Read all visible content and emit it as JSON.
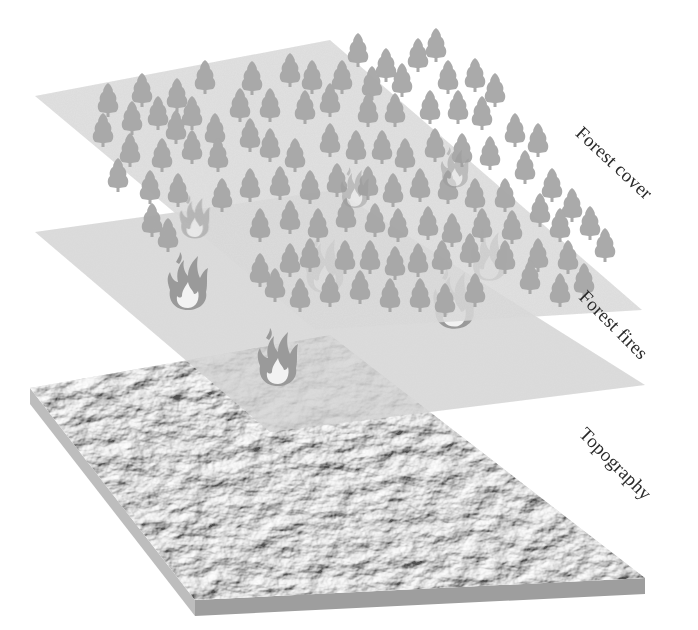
{
  "diagram": {
    "type": "gis-layer-stack",
    "layers": [
      {
        "id": "forest-cover",
        "label": "Forest cover",
        "order": 1
      },
      {
        "id": "forest-fires",
        "label": "Forest fires",
        "order": 2
      },
      {
        "id": "topography",
        "label": "Topography",
        "order": 3
      }
    ],
    "colors": {
      "plane_fill": "#d9d9d9",
      "tree": "#a8a8a8",
      "fire_outer": "#9a9a9a",
      "fire_core": "#f2f2f2",
      "terrain_light": "#eeeeee",
      "terrain_dark": "#b9b9b9",
      "slab_side_front": "#9e9e9e",
      "slab_side_left": "#bdbdbd",
      "label_text": "#2a2a2a"
    }
  }
}
